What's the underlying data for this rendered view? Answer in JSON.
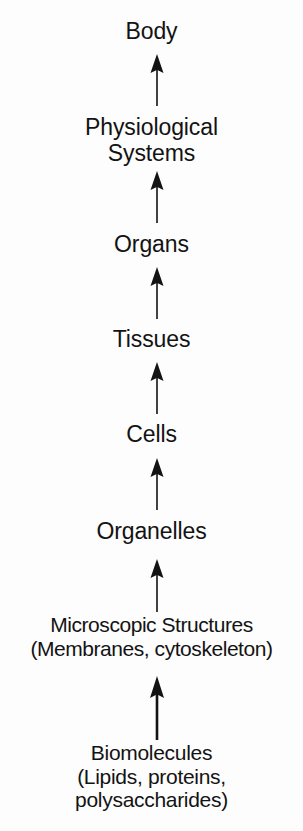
{
  "diagram": {
    "orientation": "vertical-bottom-up",
    "background_color": "#fdfdfd",
    "ink_color": "#131313",
    "levels": [
      {
        "id": "body",
        "rank": 8,
        "lines": [
          "Body"
        ]
      },
      {
        "id": "physiological-systems",
        "rank": 7,
        "lines": [
          "Physiological",
          "Systems"
        ]
      },
      {
        "id": "organs",
        "rank": 6,
        "lines": [
          "Organs"
        ]
      },
      {
        "id": "tissues",
        "rank": 5,
        "lines": [
          "Tissues"
        ]
      },
      {
        "id": "cells",
        "rank": 4,
        "lines": [
          "Cells"
        ]
      },
      {
        "id": "organelles",
        "rank": 3,
        "lines": [
          "Organelles"
        ]
      },
      {
        "id": "microscopic-structures",
        "rank": 2,
        "lines": [
          "Microscopic Structures",
          "(Membranes, cytoskeleton)"
        ]
      },
      {
        "id": "biomolecules",
        "rank": 1,
        "lines": [
          "Biomolecules",
          "(Lipids, proteins,",
          "polysaccharides)"
        ]
      }
    ],
    "connectors": [
      {
        "id": "arrow-systems-to-body",
        "from": "physiological-systems",
        "to": "body",
        "direction": "up"
      },
      {
        "id": "arrow-organs-to-systems",
        "from": "organs",
        "to": "physiological-systems",
        "direction": "up"
      },
      {
        "id": "arrow-tissues-to-organs",
        "from": "tissues",
        "to": "organs",
        "direction": "up"
      },
      {
        "id": "arrow-cells-to-tissues",
        "from": "cells",
        "to": "tissues",
        "direction": "up"
      },
      {
        "id": "arrow-organelles-to-cells",
        "from": "organelles",
        "to": "cells",
        "direction": "up"
      },
      {
        "id": "arrow-micro-to-organelles",
        "from": "microscopic-structures",
        "to": "organelles",
        "direction": "up"
      },
      {
        "id": "arrow-biomol-to-micro",
        "from": "biomolecules",
        "to": "microscopic-structures",
        "direction": "up"
      }
    ]
  }
}
